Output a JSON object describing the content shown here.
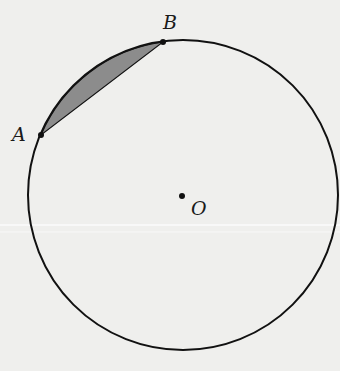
{
  "diagram": {
    "type": "circle-segment",
    "background": "#efefed",
    "stroke_color": "#111111",
    "fill_color": "#8c8c8c",
    "circle": {
      "center_label": "O",
      "cx": 183,
      "cy": 195,
      "r": 155
    },
    "points": [
      {
        "label": "A",
        "x": 41,
        "y": 135
      },
      {
        "label": "B",
        "x": 163,
        "y": 42
      }
    ],
    "shaded_region": "segment between chord AB and minor arc AB"
  }
}
